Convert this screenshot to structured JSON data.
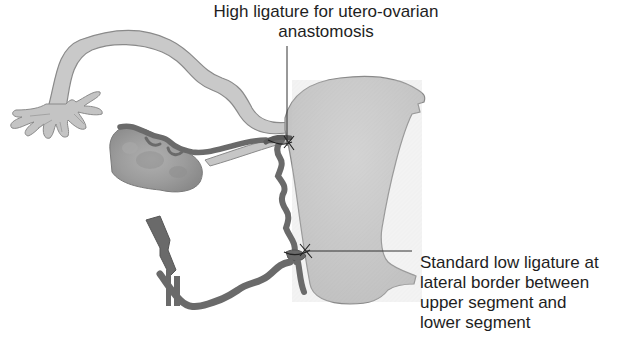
{
  "diagram": {
    "type": "anatomical illustration",
    "colors": {
      "uterus_fill": "#cbcbcb",
      "tube_fill": "#c9c9c9",
      "ovary_fill": "#a7a7a7",
      "vessel_fill": "#6a6a6a",
      "outline": "#7a7a7a",
      "label_text": "#1e1e1e",
      "leader_line": "#333333"
    },
    "structures": [
      {
        "name": "uterus"
      },
      {
        "name": "fallopian-tube"
      },
      {
        "name": "fimbriae"
      },
      {
        "name": "ovary"
      },
      {
        "name": "uterine-artery"
      },
      {
        "name": "utero-ovarian-anastomosis-vessel"
      },
      {
        "name": "internal-iliac-vessel"
      }
    ]
  },
  "labels": {
    "top": {
      "lines": [
        "High ligature for utero-ovarian",
        "anastomosis"
      ]
    },
    "right": {
      "lines": [
        "Standard low ligature at",
        "lateral border between",
        "upper segment and",
        "lower segment"
      ]
    }
  }
}
